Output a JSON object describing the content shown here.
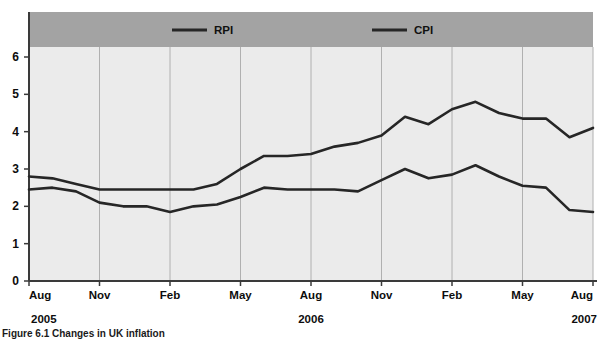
{
  "figure": {
    "caption": "Figure 6.1 Changes in UK inflation"
  },
  "legend": {
    "position": "top",
    "items": [
      {
        "label": "RPI",
        "color": "#262626"
      },
      {
        "label": "CPI",
        "color": "#262626"
      }
    ]
  },
  "axes": {
    "y_ticks": [
      "0",
      "1",
      "2",
      "3",
      "4",
      "5",
      "6"
    ],
    "x_ticks": [
      "Aug",
      "Nov",
      "Feb",
      "May",
      "Aug",
      "Nov",
      "Feb",
      "May",
      "Aug"
    ],
    "year_labels": [
      {
        "text": "2005",
        "position": "left"
      },
      {
        "text": "2006",
        "position": "center"
      },
      {
        "text": "2007",
        "position": "right"
      }
    ]
  },
  "colors": {
    "legend_band": "#a3a3a3",
    "plot_background": "#ebebeb",
    "gridline": "#b0b0b0",
    "axis": "#3a3a3a",
    "series_line": "#262626",
    "page_background": "#ffffff"
  },
  "chart_data": {
    "type": "line",
    "title": "",
    "xlabel": "",
    "ylabel": "",
    "ylim": [
      0,
      6
    ],
    "grid": true,
    "legend_position": "top",
    "x": [
      "Aug 2005",
      "Sep 2005",
      "Oct 2005",
      "Nov 2005",
      "Dec 2005",
      "Jan 2006",
      "Feb 2006",
      "Mar 2006",
      "Apr 2006",
      "May 2006",
      "Jun 2006",
      "Jul 2006",
      "Aug 2006",
      "Sep 2006",
      "Oct 2006",
      "Nov 2006",
      "Dec 2006",
      "Jan 2007",
      "Feb 2007",
      "Mar 2007",
      "Apr 2007",
      "May 2007",
      "Jun 2007",
      "Jul 2007",
      "Aug 2007"
    ],
    "x_tick_labels": [
      "Aug",
      "Nov",
      "Feb",
      "May",
      "Aug",
      "Nov",
      "Feb",
      "May",
      "Aug"
    ],
    "x_tick_indices": [
      0,
      3,
      6,
      9,
      12,
      15,
      18,
      21,
      24
    ],
    "series": [
      {
        "name": "RPI",
        "color": "#262626",
        "values": [
          2.8,
          2.75,
          2.6,
          2.45,
          2.45,
          2.45,
          2.45,
          2.45,
          2.6,
          3.0,
          3.35,
          3.35,
          3.4,
          3.6,
          3.7,
          3.9,
          4.4,
          4.2,
          4.6,
          4.8,
          4.5,
          4.35,
          4.35,
          3.85,
          4.1
        ]
      },
      {
        "name": "CPI",
        "color": "#262626",
        "values": [
          2.45,
          2.5,
          2.4,
          2.1,
          2.0,
          2.0,
          1.85,
          2.0,
          2.05,
          2.25,
          2.5,
          2.45,
          2.45,
          2.45,
          2.4,
          2.7,
          3.0,
          2.75,
          2.85,
          3.1,
          2.8,
          2.55,
          2.5,
          1.9,
          1.85
        ]
      }
    ]
  }
}
